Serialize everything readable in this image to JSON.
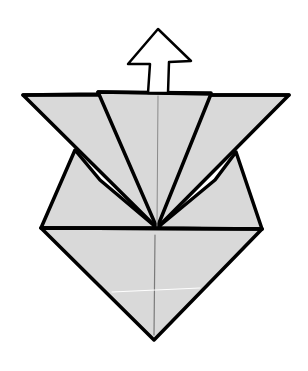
{
  "diagram": {
    "type": "origami-fold-step",
    "colors": {
      "paper_fill": "#d9d9d9",
      "outline": "#000000",
      "crease": "#888888",
      "crease_white": "#ffffff",
      "arrow_fill": "#ffffff",
      "background": "#ffffff"
    },
    "arrow": {
      "direction": "up",
      "icon": "up-arrow-icon"
    }
  }
}
